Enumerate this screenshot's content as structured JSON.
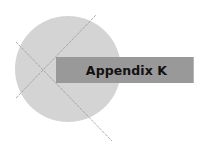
{
  "title": {
    "label": "Appendix K"
  },
  "decoration": {
    "circle_color": "#d4d4d4",
    "banner_color": "#999999",
    "line_color": "#9a9a9a"
  }
}
